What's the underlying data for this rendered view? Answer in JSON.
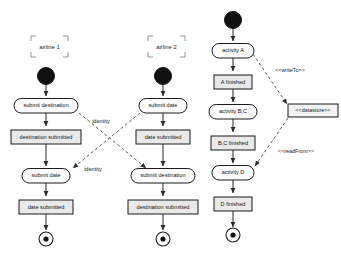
{
  "diagram": {
    "colors": {
      "node_fill": "#e9e9e9",
      "round_fill": "#fbfbfb",
      "stroke": "#1a1a1a",
      "flow": "#3a3a3a",
      "dependency": "#4a4a4a",
      "background": "#ffffff"
    }
  },
  "partitions": [
    {
      "id": "lane1",
      "label": "airline 1"
    },
    {
      "id": "lane2",
      "label": "airline 2"
    }
  ],
  "columns": {
    "left": {
      "partition": "airline 1",
      "nodes": [
        {
          "id": "l-init",
          "type": "initial-node",
          "label": ""
        },
        {
          "id": "l-a1",
          "type": "action",
          "label": "submit destination"
        },
        {
          "id": "l-s1",
          "type": "state",
          "label": "destination submitted"
        },
        {
          "id": "l-a2",
          "type": "action",
          "label": "submit date"
        },
        {
          "id": "l-s2",
          "type": "state",
          "label": "date submitted"
        },
        {
          "id": "l-final",
          "type": "final-node",
          "label": ""
        }
      ]
    },
    "middle": {
      "partition": "airline 2",
      "nodes": [
        {
          "id": "m-init",
          "type": "initial-node",
          "label": ""
        },
        {
          "id": "m-a1",
          "type": "action",
          "label": "submit date"
        },
        {
          "id": "m-s1",
          "type": "state",
          "label": "date submitted"
        },
        {
          "id": "m-a2",
          "type": "action",
          "label": "submit destination"
        },
        {
          "id": "m-s2",
          "type": "state",
          "label": "destination submitted"
        },
        {
          "id": "m-final",
          "type": "final-node",
          "label": ""
        }
      ]
    },
    "right": {
      "partition": "",
      "nodes": [
        {
          "id": "r-init",
          "type": "initial-node",
          "label": ""
        },
        {
          "id": "r-a1",
          "type": "action",
          "label": "activity A"
        },
        {
          "id": "r-s1",
          "type": "state",
          "label": "A finished"
        },
        {
          "id": "r-a2",
          "type": "action",
          "label": "activity B,C"
        },
        {
          "id": "r-s2",
          "type": "state",
          "label": "B,C finished"
        },
        {
          "id": "r-a3",
          "type": "action",
          "label": "activity D"
        },
        {
          "id": "r-s3",
          "type": "state",
          "label": "D finished"
        },
        {
          "id": "r-final",
          "type": "final-node",
          "label": ""
        }
      ]
    }
  },
  "datastore": {
    "id": "datastore-node",
    "label": "<<datastore>>"
  },
  "dependencies": [
    {
      "id": "dep-identity-1",
      "label": "identity",
      "from": "l-a1",
      "to": "m-a2"
    },
    {
      "id": "dep-identity-2",
      "label": "identity",
      "from": "m-a1",
      "to": "l-a2"
    },
    {
      "id": "dep-writeto",
      "label": "<<writeTo>>",
      "from": "r-a1",
      "to": "datastore-node"
    },
    {
      "id": "dep-readfrom",
      "label": "<<readFrom>>",
      "from": "datastore-node",
      "to": "r-a3"
    }
  ]
}
